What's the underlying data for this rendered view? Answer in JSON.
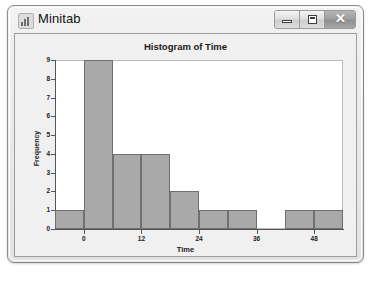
{
  "window": {
    "title": "Minitab",
    "icon": "bar-chart-icon",
    "controls": {
      "minimize_label": "",
      "maximize_label": "",
      "close_label": "✕"
    }
  },
  "caption": "",
  "chart_data": {
    "type": "bar",
    "title": "Histogram of Time",
    "xlabel": "Time",
    "ylabel": "Frequency",
    "grid": false,
    "legend": null,
    "xlim": [
      -6,
      54
    ],
    "ylim": [
      0,
      9
    ],
    "xticks": [
      0,
      12,
      24,
      36,
      48
    ],
    "yticks": [
      0,
      1,
      2,
      3,
      4,
      5,
      6,
      7,
      8,
      9
    ],
    "bin_width": 6,
    "bin_starts": [
      -6,
      0,
      6,
      12,
      18,
      24,
      30,
      36,
      42,
      48
    ],
    "categories": [
      "-6",
      "0",
      "6",
      "12",
      "18",
      "24",
      "30",
      "36",
      "42",
      "48"
    ],
    "values": [
      1,
      9,
      4,
      4,
      2,
      1,
      1,
      0,
      1,
      1
    ],
    "bar_color": "#a9a9a9",
    "bar_edge_color": "#6f6f6f"
  }
}
